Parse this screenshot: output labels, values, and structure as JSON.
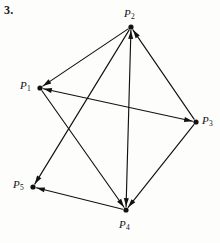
{
  "problem": {
    "number": "3."
  },
  "figure": {
    "type": "directed-graph",
    "caption": "",
    "width": 220,
    "height": 243,
    "ink_color": "#111111",
    "background_color": "#fdfdfc",
    "vertices": [
      {
        "id": "P1",
        "label": "P",
        "subscript": "1",
        "x": 40,
        "y": 88,
        "label_x": 20,
        "label_y": 80
      },
      {
        "id": "P2",
        "label": "P",
        "subscript": "2",
        "x": 131,
        "y": 27,
        "label_x": 124,
        "label_y": 8
      },
      {
        "id": "P3",
        "label": "P",
        "subscript": "3",
        "x": 196,
        "y": 122,
        "label_x": 202,
        "label_y": 115
      },
      {
        "id": "P4",
        "label": "P",
        "subscript": "4",
        "x": 126,
        "y": 210,
        "label_x": 119,
        "label_y": 219
      },
      {
        "id": "P5",
        "label": "P",
        "subscript": "5",
        "x": 33,
        "y": 187,
        "label_x": 13,
        "label_y": 179
      }
    ],
    "edges": [
      {
        "from": "P2",
        "to": "P1",
        "bidirectional": false
      },
      {
        "from": "P1",
        "to": "P3",
        "bidirectional": true
      },
      {
        "from": "P3",
        "to": "P2",
        "bidirectional": false
      },
      {
        "from": "P2",
        "to": "P4",
        "bidirectional": true
      },
      {
        "from": "P3",
        "to": "P4",
        "bidirectional": false
      },
      {
        "from": "P1",
        "to": "P4",
        "bidirectional": false
      },
      {
        "from": "P2",
        "to": "P5",
        "bidirectional": false
      },
      {
        "from": "P4",
        "to": "P5",
        "bidirectional": false
      }
    ]
  }
}
